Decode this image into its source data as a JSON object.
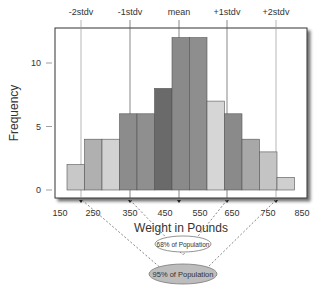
{
  "chart_data": {
    "type": "bar",
    "subtype": "histogram",
    "title": "",
    "xlabel": "Weight in Pounds",
    "ylabel": "Frequency",
    "ylim": [
      0,
      13
    ],
    "yticks": [
      0,
      5,
      10
    ],
    "xticks": [
      "150",
      "250",
      "350",
      "450",
      "550",
      "650",
      "750",
      "850"
    ],
    "grid": false,
    "bin_width": 50,
    "bins": [
      {
        "start": 175,
        "end": 225,
        "value": 2,
        "color": "#c8c8c8"
      },
      {
        "start": 225,
        "end": 275,
        "value": 4,
        "color": "#b0b0b0"
      },
      {
        "start": 275,
        "end": 325,
        "value": 4,
        "color": "#d2d2d2"
      },
      {
        "start": 325,
        "end": 375,
        "value": 6,
        "color": "#8c8c8c"
      },
      {
        "start": 375,
        "end": 425,
        "value": 6,
        "color": "#8f8f8f"
      },
      {
        "start": 425,
        "end": 475,
        "value": 8,
        "color": "#6a6a6a"
      },
      {
        "start": 475,
        "end": 525,
        "value": 12,
        "color": "#8a8a8a"
      },
      {
        "start": 525,
        "end": 575,
        "value": 12,
        "color": "#8e8e8e"
      },
      {
        "start": 575,
        "end": 625,
        "value": 7,
        "color": "#d6d6d6"
      },
      {
        "start": 625,
        "end": 675,
        "value": 6,
        "color": "#8a8a8a"
      },
      {
        "start": 675,
        "end": 725,
        "value": 4,
        "color": "#a8a8a8"
      },
      {
        "start": 725,
        "end": 775,
        "value": 3,
        "color": "#c4c4c4"
      },
      {
        "start": 775,
        "end": 825,
        "value": 1,
        "color": "#cfcfcf"
      }
    ],
    "categories": [
      "200",
      "250",
      "300",
      "350",
      "400",
      "450",
      "500",
      "550",
      "600",
      "650",
      "700",
      "750",
      "800"
    ],
    "values": [
      2,
      4,
      4,
      6,
      6,
      8,
      12,
      12,
      7,
      6,
      4,
      3,
      1
    ],
    "reference_lines": [
      {
        "label": "-2stdv",
        "x": 253
      },
      {
        "label": "-1stdv",
        "x": 357
      },
      {
        "label": "mean",
        "x": 500
      },
      {
        "label": "+1stdv",
        "x": 643
      },
      {
        "label": "+2stdv",
        "x": 760
      }
    ],
    "annotations": [
      {
        "text": "68% of Population",
        "spans": [
          "-1stdv",
          "+1stdv"
        ],
        "style": "white ellipse"
      },
      {
        "text": "95% of Population",
        "spans": [
          "-2stdv",
          "+2stdv"
        ],
        "style": "gray ellipse"
      }
    ]
  },
  "labels": {
    "ylabel": "Frequency",
    "xlabel": "Weight in Pounds",
    "ann68": "68% of Population",
    "ann95": "95% of Population"
  }
}
